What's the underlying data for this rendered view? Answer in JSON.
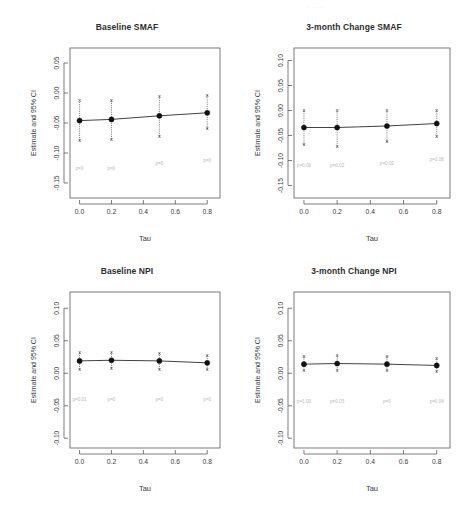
{
  "figure": {
    "width": 473,
    "height": 513,
    "background": "#ffffff",
    "ink_color": "#1f1f1f",
    "pvalue_color": "#b9b9b9",
    "ghost_header_hint": "partially cropped text row at top of scan"
  },
  "chart_data": [
    {
      "type": "scatter",
      "panel_id": "baseline-smaf",
      "title": "Baseline SMAF",
      "xlabel": "Tau",
      "ylabel": "Estimate and 95% CI",
      "x": [
        0.0,
        0.2,
        0.5,
        0.8
      ],
      "xticks": [
        0.0,
        0.2,
        0.4,
        0.6,
        0.8
      ],
      "xticklabels": [
        "0.0",
        "0.2",
        "0.4",
        "0.6",
        "0.8"
      ],
      "xlim": [
        -0.06,
        0.88
      ],
      "yticks": [
        0.05,
        0.0,
        -0.05,
        -0.1,
        -0.15
      ],
      "yticklabels": [
        "0.05",
        "0.00",
        "-0.05",
        "-0.10",
        "-0.15"
      ],
      "ylim": [
        -0.175,
        0.075
      ],
      "grid": false,
      "legend": null,
      "series": [
        {
          "name": "Estimate and 95% CI",
          "estimate": [
            -0.046,
            -0.044,
            -0.038,
            -0.033
          ],
          "ci_lower": [
            -0.079,
            -0.077,
            -0.072,
            -0.06
          ],
          "ci_upper": [
            -0.013,
            -0.012,
            -0.006,
            -0.004
          ],
          "marker": "filled-circle",
          "cap_marker": "x",
          "line": "solid"
        }
      ],
      "annotations": [
        {
          "x": 0.0,
          "y": -0.128,
          "text": "p=0"
        },
        {
          "x": 0.2,
          "y": -0.128,
          "text": "p=0"
        },
        {
          "x": 0.5,
          "y": -0.12,
          "text": "p=0"
        },
        {
          "x": 0.8,
          "y": -0.115,
          "text": "p=0"
        }
      ]
    },
    {
      "type": "scatter",
      "panel_id": "3month-change-smaf",
      "title": "3-month Change SMAF",
      "xlabel": "Tau",
      "ylabel": "Estimate and 95% CI",
      "x": [
        0.0,
        0.2,
        0.5,
        0.8
      ],
      "xticks": [
        0.0,
        0.2,
        0.4,
        0.6,
        0.8
      ],
      "xticklabels": [
        "0.0",
        "0.2",
        "0.4",
        "0.6",
        "0.8"
      ],
      "xlim": [
        -0.06,
        0.88
      ],
      "yticks": [
        0.1,
        0.05,
        0.0,
        -0.05,
        -0.1,
        -0.15
      ],
      "yticklabels": [
        "0.10",
        "0.05",
        "0.00",
        "-0.05",
        "-0.10",
        "-0.15"
      ],
      "ylim": [
        -0.175,
        0.125
      ],
      "grid": false,
      "legend": null,
      "series": [
        {
          "name": "Estimate and 95% CI",
          "estimate": [
            -0.034,
            -0.034,
            -0.031,
            -0.026
          ],
          "ci_lower": [
            -0.069,
            -0.072,
            -0.063,
            -0.052
          ],
          "ci_upper": [
            -0.001,
            -0.001,
            -0.001,
            -0.001
          ],
          "marker": "filled-circle",
          "cap_marker": "x",
          "line": "solid"
        }
      ],
      "annotations": [
        {
          "x": 0.0,
          "y": -0.113,
          "text": "p=0.06"
        },
        {
          "x": 0.2,
          "y": -0.113,
          "text": "p=0.02"
        },
        {
          "x": 0.5,
          "y": -0.108,
          "text": "p=0.02"
        },
        {
          "x": 0.8,
          "y": -0.1,
          "text": "p=0.06"
        }
      ]
    },
    {
      "type": "scatter",
      "panel_id": "baseline-npi",
      "title": "Baseline NPI",
      "xlabel": "Tau",
      "ylabel": "Estimate and 95% CI",
      "x": [
        0.0,
        0.2,
        0.5,
        0.8
      ],
      "xticks": [
        0.0,
        0.2,
        0.4,
        0.6,
        0.8
      ],
      "xticklabels": [
        "0.0",
        "0.2",
        "0.4",
        "0.6",
        "0.8"
      ],
      "xlim": [
        -0.06,
        0.88
      ],
      "yticks": [
        0.1,
        0.05,
        0.0,
        -0.05,
        -0.1
      ],
      "yticklabels": [
        "0.10",
        "0.05",
        "0.00",
        "-0.05",
        "-0.10"
      ],
      "ylim": [
        -0.115,
        0.125
      ],
      "grid": false,
      "legend": null,
      "series": [
        {
          "name": "Estimate and 95% CI",
          "estimate": [
            0.019,
            0.02,
            0.019,
            0.016
          ],
          "ci_lower": [
            0.006,
            0.008,
            0.006,
            0.005
          ],
          "ci_upper": [
            0.032,
            0.032,
            0.031,
            0.028
          ],
          "marker": "filled-circle",
          "cap_marker": "x",
          "line": "solid"
        }
      ],
      "annotations": [
        {
          "x": 0.0,
          "y": -0.042,
          "text": "p=0.01"
        },
        {
          "x": 0.2,
          "y": -0.042,
          "text": "p=0"
        },
        {
          "x": 0.5,
          "y": -0.042,
          "text": "p=0"
        },
        {
          "x": 0.8,
          "y": -0.042,
          "text": "p=0"
        }
      ]
    },
    {
      "type": "scatter",
      "panel_id": "3month-change-npi",
      "title": "3-month Change NPI",
      "xlabel": "Tau",
      "ylabel": "Estimate and 95% CI",
      "x": [
        0.0,
        0.2,
        0.5,
        0.8
      ],
      "xticks": [
        0.0,
        0.2,
        0.4,
        0.6,
        0.8
      ],
      "xticklabels": [
        "0.0",
        "0.2",
        "0.4",
        "0.6",
        "0.8"
      ],
      "xlim": [
        -0.06,
        0.88
      ],
      "yticks": [
        0.1,
        0.05,
        0.0,
        -0.05,
        -0.1
      ],
      "yticklabels": [
        "0.10",
        "0.05",
        "0.00",
        "-0.05",
        "-0.10"
      ],
      "ylim": [
        -0.115,
        0.125
      ],
      "grid": false,
      "legend": null,
      "series": [
        {
          "name": "Estimate and 95% CI",
          "estimate": [
            0.014,
            0.015,
            0.014,
            0.012
          ],
          "ci_lower": [
            0.004,
            0.004,
            0.004,
            0.003
          ],
          "ci_upper": [
            0.026,
            0.027,
            0.026,
            0.023
          ],
          "marker": "filled-circle",
          "cap_marker": "x",
          "line": "solid"
        }
      ],
      "annotations": [
        {
          "x": 0.0,
          "y": -0.045,
          "text": "p=1.00"
        },
        {
          "x": 0.2,
          "y": -0.045,
          "text": "p=0.05"
        },
        {
          "x": 0.5,
          "y": -0.045,
          "text": "p=0"
        },
        {
          "x": 0.8,
          "y": -0.045,
          "text": "p=0.04"
        }
      ]
    }
  ]
}
